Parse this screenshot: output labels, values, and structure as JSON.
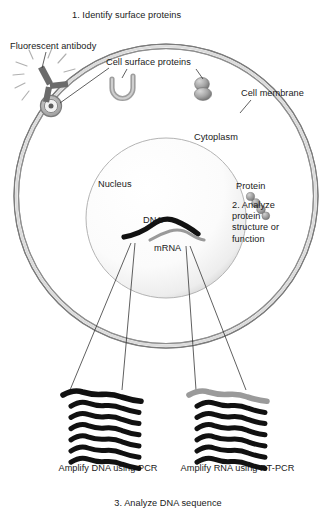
{
  "figure": {
    "title_step1": "1. Identify surface proteins",
    "title_step3": "3. Analyze DNA sequence",
    "background": "#ffffff",
    "text_color": "#1a1a1a"
  },
  "cell": {
    "membrane_label": "Cell membrane",
    "cytoplasm_label": "Cytoplasm",
    "membrane_color": "#8c8c8c",
    "membrane_fill": "#d6d6d6"
  },
  "antibody": {
    "label": "Fluorescent antibody",
    "color": "#6b6b6b",
    "ray_count": 7
  },
  "surface_proteins": {
    "label": "Cell surface proteins",
    "color": "#8f8f8f",
    "items": [
      {
        "name": "channel-protein",
        "shape": "u-shaped"
      },
      {
        "name": "receptor-protein",
        "shape": "sphere"
      },
      {
        "name": "bound-receptor-protein",
        "shape": "bullseye"
      }
    ]
  },
  "nucleus": {
    "label": "Nucleus",
    "dna_label": "DNA",
    "mrna_label": "mRNA",
    "dna_color": "#111111",
    "mrna_color": "#9a9a9a"
  },
  "protein": {
    "label": "Protein",
    "color": "#9c9c9c",
    "bead_count": 4,
    "step2": "2.\nAnalyze\nprotein\nstructure\nor function"
  },
  "gels": [
    {
      "name": "dna-gel",
      "caption": "Amplify DNA\nusing PCR",
      "band_count": 7,
      "band_colors": [
        "#111111",
        "#111111",
        "#111111",
        "#111111",
        "#111111",
        "#111111",
        "#111111"
      ]
    },
    {
      "name": "rna-gel",
      "caption": "Amplify RNA\nusing RT-PCR",
      "band_count": 7,
      "band_colors": [
        "#9a9a9a",
        "#111111",
        "#111111",
        "#111111",
        "#111111",
        "#111111",
        "#111111"
      ]
    }
  ]
}
